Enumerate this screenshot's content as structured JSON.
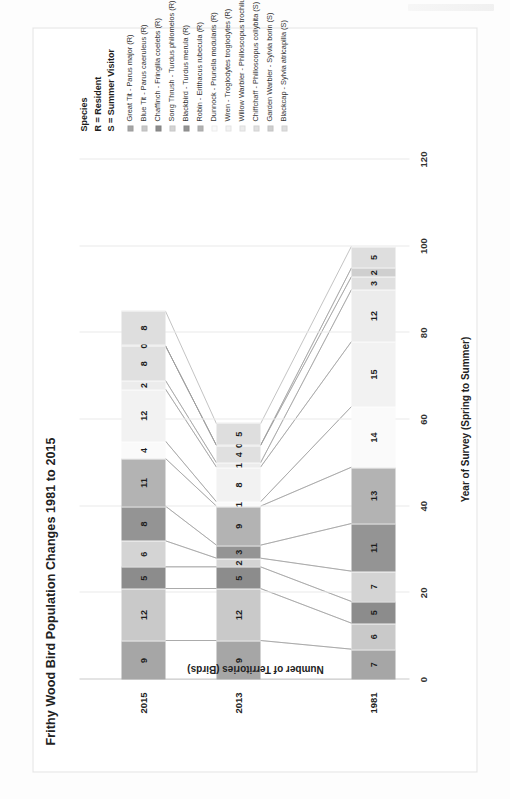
{
  "chart_data": {
    "type": "bar",
    "subtype": "stacked-horizontal-with-connectors",
    "title": "Frithy Wood Bird Population Changes 1981 to 2015",
    "xlabel": "Year of Survey (Spring to Summer)",
    "ylabel": "Number of Territories (Birds)",
    "categories": [
      "1981",
      "2013",
      "2015"
    ],
    "ylim": [
      0,
      120
    ],
    "yticks": [
      0,
      20,
      40,
      60,
      80,
      100,
      120
    ],
    "grid": true,
    "legend_position": "right",
    "legend_title_lines": [
      "Species",
      "R = Resident",
      "S = Summer Visitor"
    ],
    "series": [
      {
        "name": "Great Tit - Parus major (R)",
        "color": "#a6a6a6",
        "values": [
          7,
          9,
          9
        ]
      },
      {
        "name": "Blue Tit - Parus caeruleus  (R)",
        "color": "#c9c9c9",
        "values": [
          6,
          12,
          12
        ]
      },
      {
        "name": "Chaffinch - Fringilla coelebs  (R)",
        "color": "#8c8c8c",
        "values": [
          5,
          5,
          5
        ]
      },
      {
        "name": "Song Thrush - Turdus philomelos  (R)",
        "color": "#d4d4d4",
        "values": [
          7,
          2,
          6
        ]
      },
      {
        "name": "Blackbird - Turdus merula  (R)",
        "color": "#949494",
        "values": [
          11,
          3,
          8
        ]
      },
      {
        "name": "Robin - Erithacus rubecula  (R)",
        "color": "#b3b3b3",
        "values": [
          13,
          9,
          11
        ]
      },
      {
        "name": "Dunnock - Prunella modularis  (R)",
        "color": "#fafafa",
        "values": [
          14,
          1,
          4
        ]
      },
      {
        "name": "Wren - Troglodytes troglodytes  (R)",
        "color": "#f2f2f2",
        "values": [
          15,
          8,
          12
        ]
      },
      {
        "name": "Willow Warbler - Philloscopus trochilus  (S)",
        "color": "#ececec",
        "values": [
          12,
          1,
          2
        ]
      },
      {
        "name": "Chiffchaff - Philloscopus collybita  (S)",
        "color": "#e0e0e0",
        "values": [
          3,
          4,
          8
        ]
      },
      {
        "name": "Garden Warbler - Sylvia borin (S)",
        "color": "#cfcfcf",
        "values": [
          2,
          0,
          0
        ]
      },
      {
        "name": "Blackcap - Sylvia atricapilla  (S)",
        "color": "#dedede",
        "values": [
          5,
          5,
          8
        ]
      }
    ]
  }
}
